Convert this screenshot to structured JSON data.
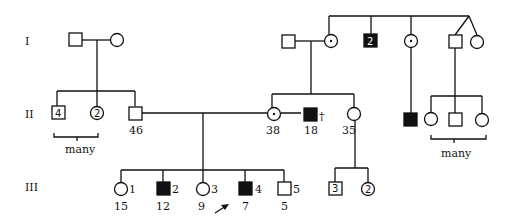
{
  "pedigree": {
    "generations": [
      "I",
      "II",
      "III"
    ],
    "gen1": {
      "left_inner": "",
      "num_2_label": "2"
    },
    "gen2": {
      "sibs_male_count": "4",
      "sibs_female_count": "2",
      "male_age": "46",
      "carrier_female_age": "38",
      "affected_male_age": "18",
      "deceased_mark": "†",
      "female_age": "35",
      "many_left": "many",
      "many_right": "many"
    },
    "gen3": {
      "ids": [
        "1",
        "2",
        "3",
        "4",
        "5"
      ],
      "ages": [
        "15",
        "12",
        "9",
        "7",
        "5"
      ],
      "right_male_count": "3",
      "right_female_count": "2"
    }
  }
}
